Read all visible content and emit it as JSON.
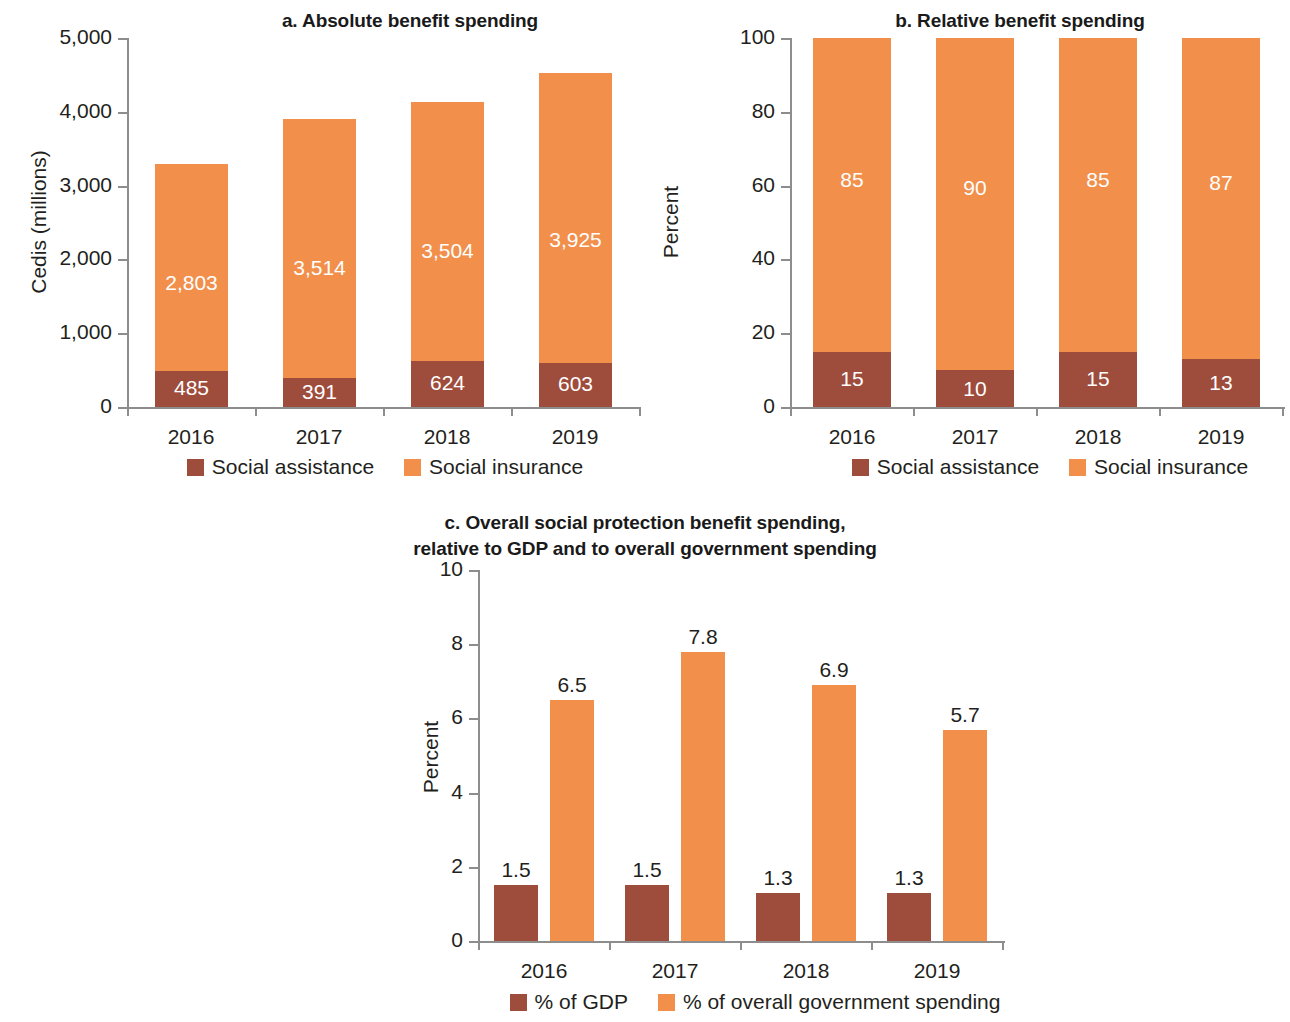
{
  "figure": {
    "colors": {
      "social_assistance": "#9E4C3C",
      "social_insurance": "#F18F4B",
      "axis": "#8d8d8d",
      "text": "#231f20",
      "value_label_light": "#ffffff"
    }
  },
  "chart_data": [
    {
      "id": "panel_a",
      "type": "bar",
      "stacked": true,
      "title": "a. Absolute benefit spending",
      "xlabel": "",
      "ylabel": "Cedis (millions)",
      "ylim": [
        0,
        5000
      ],
      "yticks": [
        0,
        1000,
        2000,
        3000,
        4000,
        5000
      ],
      "ytick_labels": [
        "0",
        "1,000",
        "2,000",
        "3,000",
        "4,000",
        "5,000"
      ],
      "categories": [
        "2016",
        "2017",
        "2018",
        "2019"
      ],
      "grid": false,
      "legend_position": "bottom",
      "series": [
        {
          "name": "Social assistance",
          "color": "#9E4C3C",
          "values": [
            485,
            391,
            624,
            603
          ],
          "labels": [
            "485",
            "391",
            "624",
            "603"
          ]
        },
        {
          "name": "Social insurance",
          "color": "#F18F4B",
          "values": [
            2803,
            3514,
            3504,
            3925
          ],
          "labels": [
            "2,803",
            "3,514",
            "3,504",
            "3,925"
          ]
        }
      ],
      "totals": [
        3288,
        3905,
        4128,
        4528
      ]
    },
    {
      "id": "panel_b",
      "type": "bar",
      "stacked": true,
      "title": "b. Relative benefit spending",
      "xlabel": "",
      "ylabel": "Percent",
      "ylim": [
        0,
        100
      ],
      "yticks": [
        0,
        20,
        40,
        60,
        80,
        100
      ],
      "ytick_labels": [
        "0",
        "20",
        "40",
        "60",
        "80",
        "100"
      ],
      "categories": [
        "2016",
        "2017",
        "2018",
        "2019"
      ],
      "grid": false,
      "legend_position": "bottom",
      "series": [
        {
          "name": "Social assistance",
          "color": "#9E4C3C",
          "values": [
            15,
            10,
            15,
            13
          ],
          "labels": [
            "15",
            "10",
            "15",
            "13"
          ]
        },
        {
          "name": "Social insurance",
          "color": "#F18F4B",
          "values": [
            85,
            90,
            85,
            87
          ],
          "labels": [
            "85",
            "90",
            "85",
            "87"
          ]
        }
      ]
    },
    {
      "id": "panel_c",
      "type": "bar",
      "stacked": false,
      "title_line1": "c. Overall social protection benefit spending,",
      "title_line2": "relative to GDP and to overall government spending",
      "xlabel": "",
      "ylabel": "Percent",
      "ylim": [
        0,
        10
      ],
      "yticks": [
        0,
        2,
        4,
        6,
        8,
        10
      ],
      "ytick_labels": [
        "0",
        "2",
        "4",
        "6",
        "8",
        "10"
      ],
      "categories": [
        "2016",
        "2017",
        "2018",
        "2019"
      ],
      "grid": false,
      "legend_position": "bottom",
      "series": [
        {
          "name": "% of GDP",
          "color": "#9E4C3C",
          "values": [
            1.5,
            1.5,
            1.3,
            1.3
          ],
          "labels": [
            "1.5",
            "1.5",
            "1.3",
            "1.3"
          ]
        },
        {
          "name": "% of overall government spending",
          "color": "#F18F4B",
          "values": [
            6.5,
            7.8,
            6.9,
            5.7
          ],
          "labels": [
            "6.5",
            "7.8",
            "6.9",
            "5.7"
          ]
        }
      ]
    }
  ]
}
